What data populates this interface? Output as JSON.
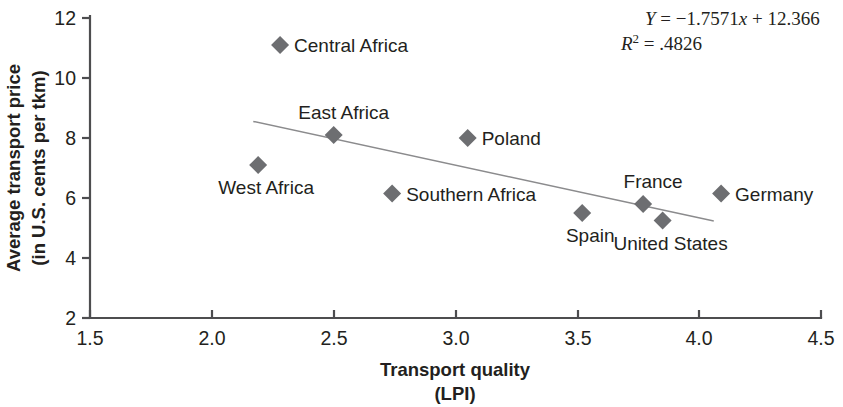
{
  "chart_data": {
    "type": "scatter",
    "title": "",
    "xlabel": "Transport quality",
    "xlabel_sub": "(LPI)",
    "ylabel_line1": "Average transport price",
    "ylabel_line2": "(in U.S. cents per tkm)",
    "xlim": [
      1.5,
      4.5
    ],
    "ylim": [
      2,
      12
    ],
    "xticks": [
      "1.5",
      "2.0",
      "2.5",
      "3.0",
      "3.5",
      "4.0",
      "4.5"
    ],
    "xtick_values": [
      1.5,
      2.0,
      2.5,
      3.0,
      3.5,
      4.0,
      4.5
    ],
    "yticks": [
      "2",
      "4",
      "6",
      "8",
      "10",
      "12"
    ],
    "ytick_values": [
      2,
      4,
      6,
      8,
      10,
      12
    ],
    "grid": false,
    "legend": "none",
    "marker_shape": "diamond",
    "marker_color": "#6d6e71",
    "trendline_color": "#8b8b8d",
    "points": [
      {
        "label": "Central Africa",
        "x": 2.28,
        "y": 11.1,
        "label_side": "right"
      },
      {
        "label": "East Africa",
        "x": 2.5,
        "y": 8.1,
        "label_side": "above"
      },
      {
        "label": "West Africa",
        "x": 2.19,
        "y": 7.1,
        "label_side": "below"
      },
      {
        "label": "Southern Africa",
        "x": 2.74,
        "y": 6.15,
        "label_side": "right"
      },
      {
        "label": "Poland",
        "x": 3.05,
        "y": 8.0,
        "label_side": "right"
      },
      {
        "label": "Spain",
        "x": 3.52,
        "y": 5.5,
        "label_side": "below"
      },
      {
        "label": "France",
        "x": 3.77,
        "y": 5.8,
        "label_side": "above"
      },
      {
        "label": "United States",
        "x": 3.85,
        "y": 5.25,
        "label_side": "below"
      },
      {
        "label": "Germany",
        "x": 4.09,
        "y": 6.15,
        "label_side": "right"
      }
    ],
    "trendline": {
      "slope": -1.7571,
      "intercept": 12.366,
      "x_start": 2.17,
      "x_end": 4.06
    },
    "annotations": {
      "equation_y": "Y",
      "equation_body": " = −1.7571",
      "equation_x": "x",
      "equation_tail": " + 12.366",
      "equation_full": "Y = −1.7571x + 12.366",
      "r_symbol": "R",
      "r_exponent": "2",
      "r_value": " = .4826",
      "r_squared_full": "R² = .4826"
    }
  }
}
